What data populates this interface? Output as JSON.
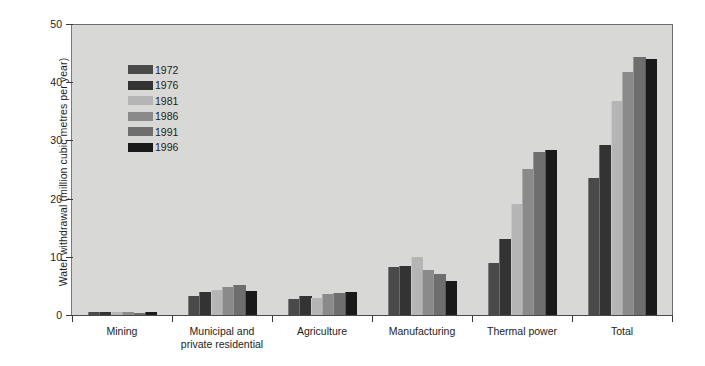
{
  "chart_data": {
    "type": "bar",
    "title": "",
    "xlabel": "",
    "ylabel": "Water withdrawal (million cubic metres per year)",
    "ylim": [
      0,
      50
    ],
    "yticks": [
      0,
      10,
      20,
      30,
      40,
      50
    ],
    "grid": false,
    "legend_position": "upper-left-inside",
    "categories": [
      "Mining",
      "Municipal and private residential",
      "Agriculture",
      "Manufacturing",
      "Thermal power",
      "Total"
    ],
    "category_lines": [
      [
        "Mining"
      ],
      [
        "Municipal and",
        "private residential"
      ],
      [
        "Agriculture"
      ],
      [
        "Manufacturing"
      ],
      [
        "Thermal power"
      ],
      [
        "Total"
      ]
    ],
    "series": [
      {
        "name": "1972",
        "color": "#4a4a4a",
        "values": [
          0.5,
          3.2,
          2.8,
          8.2,
          9.0,
          23.6
        ]
      },
      {
        "name": "1976",
        "color": "#333333",
        "values": [
          0.6,
          4.0,
          3.3,
          8.5,
          13.0,
          29.2
        ]
      },
      {
        "name": "1981",
        "color": "#b5b5b5",
        "values": [
          0.5,
          4.3,
          3.0,
          10.0,
          19.1,
          36.8
        ]
      },
      {
        "name": "1986",
        "color": "#8a8a8a",
        "values": [
          0.5,
          4.8,
          3.6,
          7.8,
          25.1,
          41.7
        ]
      },
      {
        "name": "1991",
        "color": "#6e6e6e",
        "values": [
          0.4,
          5.1,
          3.7,
          7.0,
          28.0,
          44.3
        ]
      },
      {
        "name": "1996",
        "color": "#1a1a1a",
        "values": [
          0.6,
          4.2,
          3.9,
          5.8,
          28.3,
          44.0
        ]
      }
    ]
  },
  "legend": {
    "items": [
      {
        "label": "1972"
      },
      {
        "label": "1976"
      },
      {
        "label": "1981"
      },
      {
        "label": "1986"
      },
      {
        "label": "1991"
      },
      {
        "label": "1996"
      }
    ]
  },
  "colors": {
    "plot_background": "#d8d8d6",
    "page_background": "#ffffff",
    "axis": "#3a3a3a",
    "text": "#1d1d1d"
  }
}
